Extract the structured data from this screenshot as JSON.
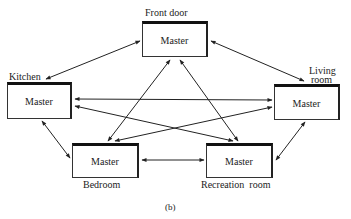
{
  "diagram": {
    "caption": "(b)",
    "nodes": [
      {
        "id": "front-door",
        "label": "Front door",
        "role": "Master"
      },
      {
        "id": "kitchen",
        "label": "Kitchen",
        "role": "Master"
      },
      {
        "id": "living-room",
        "label_line1": "Living",
        "label_line2": "room",
        "role": "Master"
      },
      {
        "id": "bedroom",
        "label": "Bedroom",
        "role": "Master"
      },
      {
        "id": "recreation-room",
        "label": "Recreation  room",
        "role": "Master"
      }
    ],
    "edges": [
      [
        "front-door",
        "kitchen"
      ],
      [
        "front-door",
        "living-room"
      ],
      [
        "front-door",
        "bedroom"
      ],
      [
        "front-door",
        "recreation-room"
      ],
      [
        "kitchen",
        "living-room"
      ],
      [
        "kitchen",
        "recreation-room"
      ],
      [
        "living-room",
        "bedroom"
      ],
      [
        "kitchen",
        "bedroom"
      ],
      [
        "living-room",
        "recreation-room"
      ],
      [
        "bedroom",
        "recreation-room"
      ]
    ],
    "edge_style": "bidirectional-arrow"
  }
}
